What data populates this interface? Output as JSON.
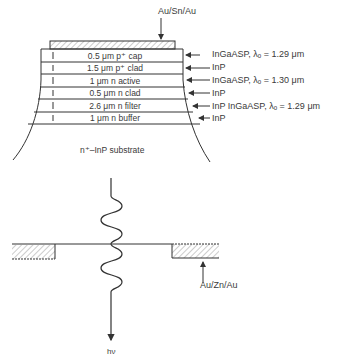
{
  "top_contact": {
    "label": "Au/Sn/Au"
  },
  "layers": [
    {
      "label": "0.5 μm p⁺ cap",
      "material": "InGaASP, λₒ = 1.29 μm"
    },
    {
      "label": "1.5 μm p⁺ clad",
      "material": "InP"
    },
    {
      "label": "1 μm n active",
      "material": "InGaASP, λₒ = 1.30 μm"
    },
    {
      "label": "0.5 μm n clad",
      "material": "InP"
    },
    {
      "label": "2.6 μm n filter",
      "material": "InP   InGaASP, λₒ = 1.29 μm"
    },
    {
      "label": "1 μm n buffer",
      "material": "InP"
    }
  ],
  "substrate": {
    "label": "n⁺–InP substrate"
  },
  "bottom_contact": {
    "label": "Au/Zn/Au"
  },
  "emission": {
    "label": "hν"
  }
}
